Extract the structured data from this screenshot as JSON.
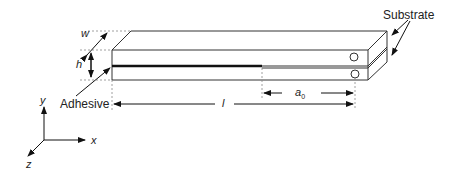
{
  "diagram": {
    "labels": {
      "substrate": "Substrate",
      "adhesive": "Adhesive",
      "width": "w",
      "height": "h",
      "length": "l",
      "crack_length": "a",
      "crack_length_sub": "0",
      "axis_x": "x",
      "axis_y": "y",
      "axis_z": "z"
    },
    "colors": {
      "line": "#333333",
      "adhesive": "#111111",
      "dashed": "#888888"
    }
  }
}
